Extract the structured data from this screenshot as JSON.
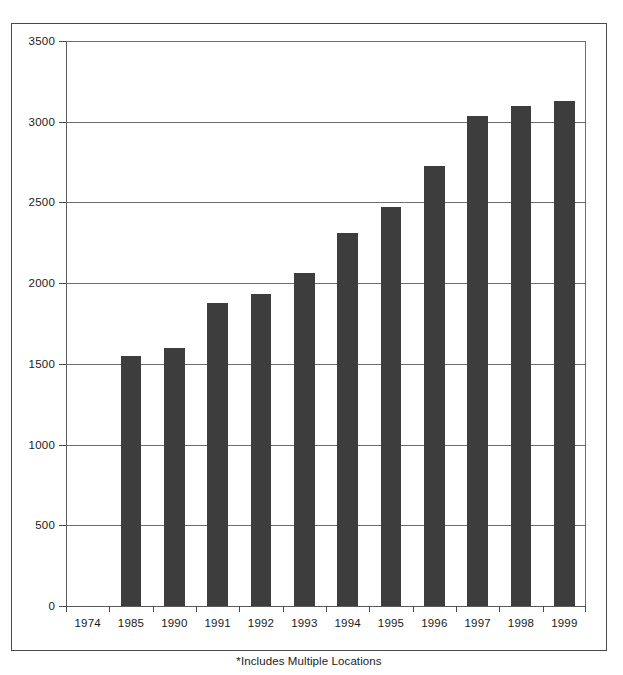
{
  "chart_data": {
    "type": "bar",
    "title": "",
    "subtitle": "",
    "xlabel": "",
    "ylabel": "",
    "categories": [
      "1974",
      "1985",
      "1990",
      "1991",
      "1992",
      "1993",
      "1994",
      "1995",
      "1996",
      "1997",
      "1998",
      "1999"
    ],
    "values": [
      0,
      1550,
      1600,
      1875,
      1935,
      2065,
      2310,
      2470,
      2725,
      3035,
      3095,
      3130
    ],
    "series": [
      {
        "name": "",
        "values": [
          0,
          1550,
          1600,
          1875,
          1935,
          2065,
          2310,
          2470,
          2725,
          3035,
          3095,
          3130
        ]
      }
    ],
    "ylim": [
      0,
      3500
    ],
    "yticks": [
      0,
      500,
      1000,
      1500,
      2000,
      2500,
      3000,
      3500
    ],
    "ytick_labels": [
      "0",
      "500",
      "1000",
      "1500",
      "2000",
      "2500",
      "3000",
      "3500"
    ],
    "grid": true,
    "legend": false,
    "legend_position": "none",
    "annotations": [
      "*Includes Multiple Locations"
    ],
    "bar_color": "#3d3d3d",
    "grid_color": "#6e6e6e",
    "axis_color": "#4a4a4a",
    "frame_color": "#4a4a4a",
    "background": "#ffffff"
  },
  "footnote": "*Includes Multiple Locations"
}
